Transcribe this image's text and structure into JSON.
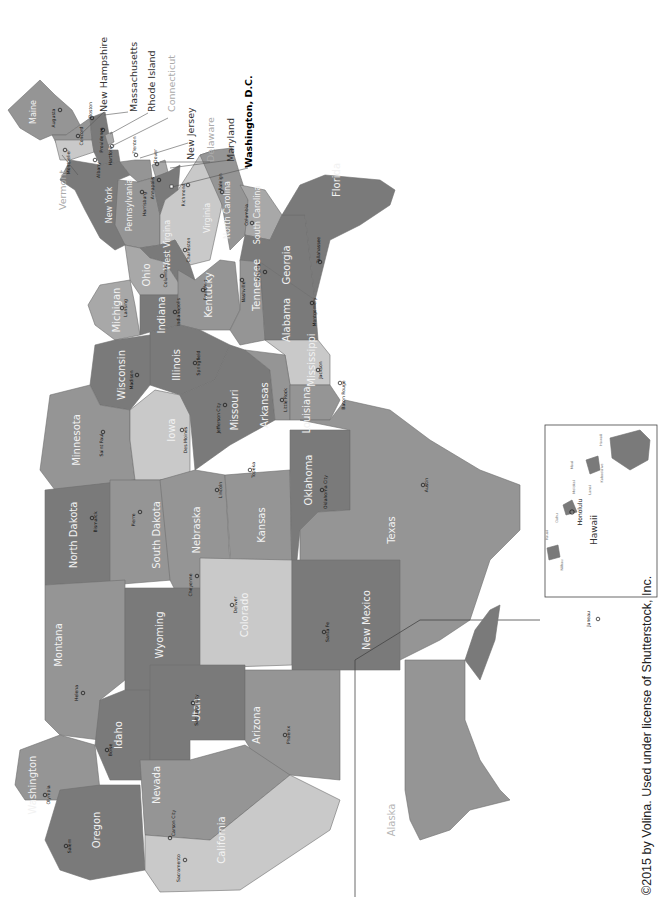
{
  "map": {
    "title": "United States of America — States and Capitals",
    "orientation": "rotated 90° clockwise (north at left)",
    "colors": {
      "dark": "#7a7a7a",
      "medium": "#959595",
      "mid_light": "#a8a8a8",
      "light": "#c9c9c9",
      "label_light": "#f2f2f2",
      "capital_text": "#111111",
      "background": "#ffffff"
    },
    "states": [
      {
        "name": "Maine",
        "capital": "Augusta"
      },
      {
        "name": "New Hampshire",
        "capital": "Concord"
      },
      {
        "name": "Vermont",
        "capital": "Montpelier"
      },
      {
        "name": "Massachusetts",
        "capital": "Boston"
      },
      {
        "name": "Rhode Island",
        "capital": "Providence"
      },
      {
        "name": "Connecticut",
        "capital": "Hartford"
      },
      {
        "name": "New York",
        "capital": "Albany"
      },
      {
        "name": "New Jersey",
        "capital": "Trenton"
      },
      {
        "name": "Pennsylvania",
        "capital": "Harrisburg"
      },
      {
        "name": "Delaware",
        "capital": "Dover"
      },
      {
        "name": "Maryland",
        "capital": "Annapolis"
      },
      {
        "name": "Virginia",
        "capital": "Richmond"
      },
      {
        "name": "West Virgina",
        "capital": "Charleston"
      },
      {
        "name": "North Carolina",
        "capital": "Raleigh"
      },
      {
        "name": "South Carolina",
        "capital": "Columbia"
      },
      {
        "name": "Georgia",
        "capital": "Atlanta"
      },
      {
        "name": "Florida",
        "capital": "Tallahassee"
      },
      {
        "name": "Ohio",
        "capital": "Columbus"
      },
      {
        "name": "Michigan",
        "capital": "Lansing"
      },
      {
        "name": "Indiana",
        "capital": "Indianapolis"
      },
      {
        "name": "Kentucky",
        "capital": "Frankfort"
      },
      {
        "name": "Tennessee",
        "capital": "Nashville"
      },
      {
        "name": "Alabama",
        "capital": "Montgomery"
      },
      {
        "name": "Mississippi",
        "capital": "Jackson"
      },
      {
        "name": "Illinois",
        "capital": "Springfield"
      },
      {
        "name": "Wisconsin",
        "capital": "Madison"
      },
      {
        "name": "Minnesota",
        "capital": "Saint Paul"
      },
      {
        "name": "Iowa",
        "capital": "Des Moines"
      },
      {
        "name": "Missouri",
        "capital": "Jefferson City"
      },
      {
        "name": "Arkansas",
        "capital": "Little Rock"
      },
      {
        "name": "Louisiana",
        "capital": "Baton Rouge"
      },
      {
        "name": "North Dakota",
        "capital": "Bismarck"
      },
      {
        "name": "South Dakota",
        "capital": "Pierre"
      },
      {
        "name": "Nebraska",
        "capital": "Lincoln"
      },
      {
        "name": "Kansas",
        "capital": "Topeka"
      },
      {
        "name": "Oklahoma",
        "capital": "Oklahoma City"
      },
      {
        "name": "Texas",
        "capital": "Austin"
      },
      {
        "name": "Montana",
        "capital": "Helena"
      },
      {
        "name": "Wyoming",
        "capital": "Cheyenne"
      },
      {
        "name": "Colorado",
        "capital": "Denver"
      },
      {
        "name": "New Mexico",
        "capital": "Santa Fe"
      },
      {
        "name": "Idaho",
        "capital": "Boise"
      },
      {
        "name": "Utah",
        "capital": "Salt Lake City"
      },
      {
        "name": "Arizona",
        "capital": "Phoenix"
      },
      {
        "name": "Washington",
        "capital": "Olympia"
      },
      {
        "name": "Oregon",
        "capital": "Salem"
      },
      {
        "name": "Nevada",
        "capital": "Carson City"
      },
      {
        "name": "California",
        "capital": "Sacramento"
      },
      {
        "name": "Alaska",
        "capital": "Juneau"
      },
      {
        "name": "Hawaii",
        "capital": "Honolulu"
      }
    ],
    "callouts": [
      "New Hampshire",
      "Massachusetts",
      "Rhode Island",
      "Connecticut",
      "New Jersey",
      "Delaware",
      "Maryland",
      "Washington, D.C.",
      "Vermont"
    ],
    "hawaii_islands": [
      "Kauai",
      "Niihau",
      "Oahu",
      "Molokai",
      "Lanai",
      "Maui",
      "Kahoolawe",
      "Hawaii"
    ],
    "insets": {
      "alaska_label": "Alaska",
      "hawaii_label": "Hawaii",
      "alaska_capital": "Juneau",
      "hawaii_capital": "Honolulu"
    }
  },
  "copyright": "©2015 by Volina. Used under license of Shutterstock, Inc."
}
